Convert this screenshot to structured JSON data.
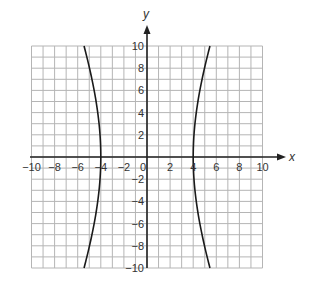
{
  "chart_data": {
    "type": "line",
    "title": "",
    "xlabel": "x",
    "ylabel": "y",
    "xlim": [
      -10,
      10
    ],
    "ylim": [
      -10,
      10
    ],
    "grid": true,
    "grid_step": 1,
    "x_ticks": [
      -10,
      -8,
      -6,
      -4,
      -2,
      0,
      2,
      4,
      6,
      8,
      10
    ],
    "y_ticks": [
      -10,
      -8,
      -6,
      -4,
      -2,
      2,
      4,
      6,
      8,
      10
    ],
    "origin_label": "0",
    "series": [
      {
        "name": "hyperbola",
        "equation": "x^2/16 - y^2/117 = 1",
        "a": 4,
        "b": 10.8,
        "branches": [
          "left",
          "right"
        ],
        "vertices": [
          [
            -4,
            0
          ],
          [
            4,
            0
          ]
        ],
        "sample_points": [
          [
            -5.45,
            10
          ],
          [
            -4.98,
            7
          ],
          [
            -4.52,
            4
          ],
          [
            -4.13,
            2
          ],
          [
            -4,
            0
          ],
          [
            -4.13,
            -2
          ],
          [
            -4.52,
            -4
          ],
          [
            -4.98,
            -7
          ],
          [
            -5.45,
            -10
          ],
          [
            5.45,
            10
          ],
          [
            4.98,
            7
          ],
          [
            4.52,
            4
          ],
          [
            4.13,
            2
          ],
          [
            4,
            0
          ],
          [
            4.13,
            -2
          ],
          [
            4.52,
            -4
          ],
          [
            4.98,
            -7
          ],
          [
            5.45,
            -10
          ]
        ]
      }
    ]
  },
  "layout": {
    "origin_px": [
      147,
      157
    ],
    "px_per_unit_x": 11.55,
    "px_per_unit_y": 11.1,
    "colors": {
      "grid": "#b5b5b5",
      "axis": "#222222",
      "curve": "#1a1a1a",
      "text": "#333333"
    }
  }
}
